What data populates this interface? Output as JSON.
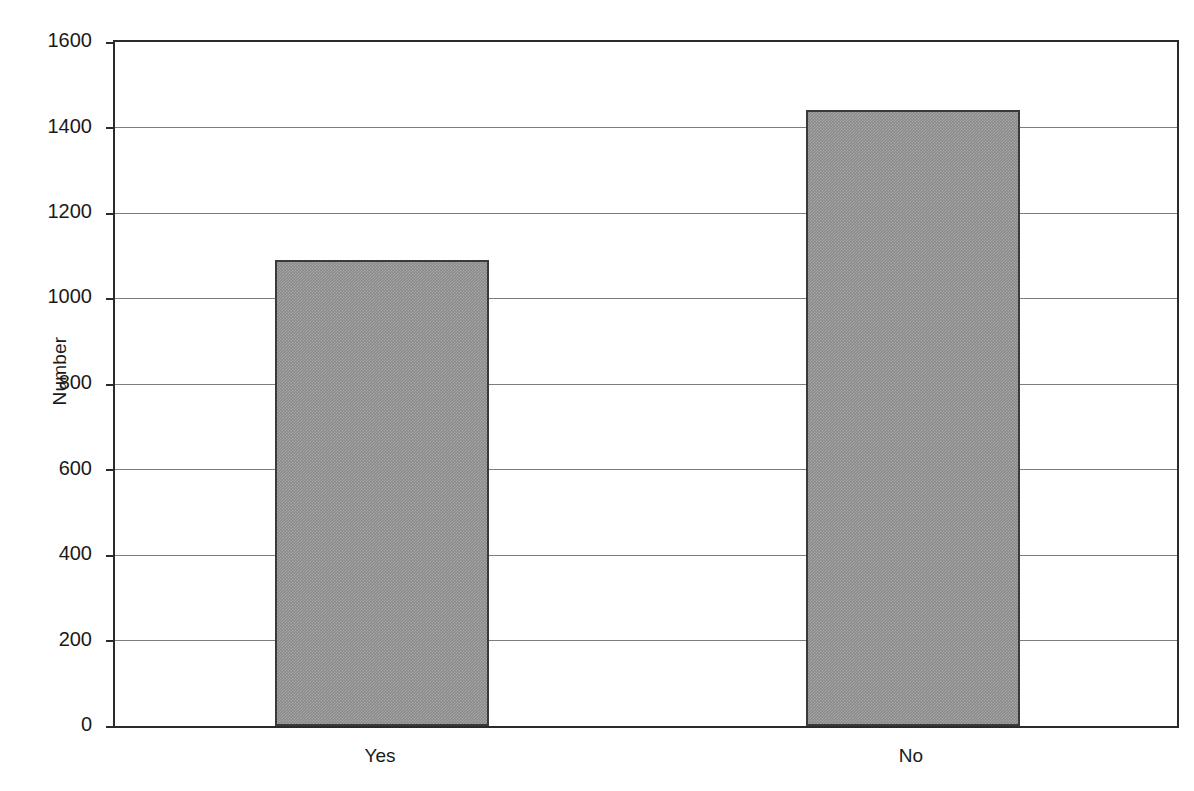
{
  "chart_data": {
    "type": "bar",
    "title": "",
    "subtitle": "",
    "xlabel": "",
    "ylabel": "Number",
    "categories": [
      "Yes",
      "No"
    ],
    "values": [
      1090,
      1440
    ],
    "ylim": [
      0,
      1600
    ],
    "yticks": [
      0,
      200,
      400,
      600,
      800,
      1000,
      1200,
      1400,
      1600
    ],
    "ytick_labels": [
      "0",
      "200",
      "400",
      "600",
      "800",
      "1000",
      "1200",
      "1400",
      "1600"
    ],
    "grid": true,
    "grid_axis": "y",
    "legend": false,
    "legend_position": "none",
    "series": [
      {
        "name": "Number",
        "values": [
          1090,
          1440
        ],
        "color": "#8b8b8b",
        "edge_color": "#3a3a3a"
      }
    ],
    "annotations": []
  },
  "axes": {
    "y_title": "Number",
    "frame_color": "#2b2b2b",
    "gridline_color": "#7d7d7d",
    "background": "#ffffff"
  },
  "ticks": {
    "y": [
      {
        "label": "1600",
        "value": 1600
      },
      {
        "label": "1400",
        "value": 1400
      },
      {
        "label": "1200",
        "value": 1200
      },
      {
        "label": "1000",
        "value": 1000
      },
      {
        "label": "800",
        "value": 800
      },
      {
        "label": "600",
        "value": 600
      },
      {
        "label": "400",
        "value": 400
      },
      {
        "label": "200",
        "value": 200
      },
      {
        "label": "0",
        "value": 0
      }
    ],
    "x": [
      {
        "label": "Yes"
      },
      {
        "label": "No"
      }
    ]
  }
}
